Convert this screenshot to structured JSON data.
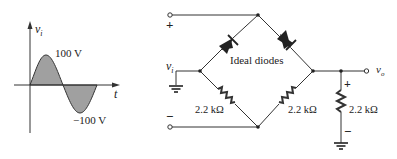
{
  "waveform": {
    "y_axis_label": "v",
    "y_axis_sub": "i",
    "x_axis_label": "t",
    "peak_label": "100 V",
    "trough_label": "−100 V",
    "fill_color": "#a0a0a0"
  },
  "circuit": {
    "input_label": "v",
    "input_sub": "i",
    "output_label": "v",
    "output_sub": "o",
    "plus_input": "+",
    "minus_input": "−",
    "plus_output": "+",
    "minus_output": "−",
    "diode_label": "Ideal diodes",
    "resistor_left_label": "2.2 kΩ",
    "resistor_right_label": "2.2 kΩ",
    "resistor_load_label": "2.2 kΩ"
  }
}
